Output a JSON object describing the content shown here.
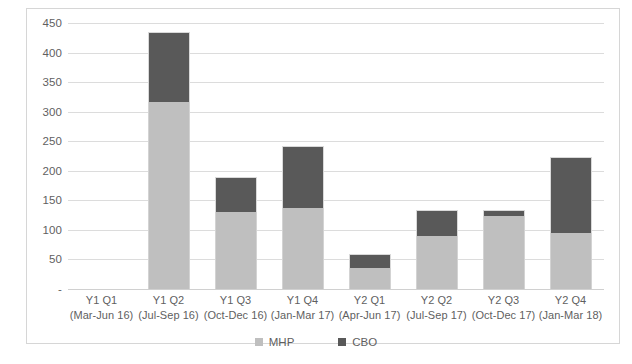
{
  "chart_data": {
    "type": "bar",
    "subtype": "stacked-vertical",
    "title": "",
    "subtitle": "",
    "xlabel": "",
    "ylabel": "",
    "ylim": [
      0,
      450
    ],
    "ytick_values": [
      450,
      400,
      350,
      300,
      250,
      200,
      150,
      100,
      50,
      0
    ],
    "ytick_labels": [
      "450",
      "400",
      "350",
      "300",
      "250",
      "200",
      "150",
      "100",
      "50",
      "-"
    ],
    "grid": true,
    "legend_position": "bottom",
    "categories": [
      "Y1 Q1\n(Mar-Jun 16)",
      "Y1 Q2\n(Jul-Sep 16)",
      "Y1 Q3\n(Oct-Dec 16)",
      "Y1 Q4\n(Jan-Mar 17)",
      "Y2 Q1\n(Apr-Jun 17)",
      "Y2 Q2\n(Jul-Sep 17)",
      "Y2 Q3\n(Oct-Dec 17)",
      "Y2 Q4\n(Jan-Mar 18)"
    ],
    "series": [
      {
        "name": "MHP",
        "color": "#bfbfbf",
        "values": [
          0,
          317,
          130,
          137,
          35,
          89,
          123,
          94
        ]
      },
      {
        "name": "CBO",
        "color": "#595959",
        "values": [
          0,
          118,
          60,
          105,
          25,
          45,
          10,
          130
        ]
      }
    ],
    "totals": [
      0,
      435,
      190,
      242,
      60,
      134,
      133,
      224
    ]
  },
  "axis": {
    "yticks": [
      {
        "label": "450",
        "value": 450
      },
      {
        "label": "400",
        "value": 400
      },
      {
        "label": "350",
        "value": 350
      },
      {
        "label": "300",
        "value": 300
      },
      {
        "label": "250",
        "value": 250
      },
      {
        "label": "200",
        "value": 200
      },
      {
        "label": "150",
        "value": 150
      },
      {
        "label": "100",
        "value": 100
      },
      {
        "label": "50",
        "value": 50
      },
      {
        "label": "-",
        "value": 0
      }
    ],
    "xticks": [
      {
        "line1": "Y1 Q1",
        "line2": "(Mar-Jun 16)"
      },
      {
        "line1": "Y1 Q2",
        "line2": "(Jul-Sep 16)"
      },
      {
        "line1": "Y1 Q3",
        "line2": "(Oct-Dec 16)"
      },
      {
        "line1": "Y1 Q4",
        "line2": "(Jan-Mar 17)"
      },
      {
        "line1": "Y2 Q1",
        "line2": "(Apr-Jun 17)"
      },
      {
        "line1": "Y2 Q2",
        "line2": "(Jul-Sep 17)"
      },
      {
        "line1": "Y2 Q3",
        "line2": "(Oct-Dec 17)"
      },
      {
        "line1": "Y2 Q4",
        "line2": "(Jan-Mar 18)"
      }
    ]
  },
  "legend": {
    "items": [
      {
        "label": "MHP",
        "color": "#bfbfbf",
        "icon": "square-marker-icon"
      },
      {
        "label": "CBO",
        "color": "#595959",
        "icon": "square-marker-icon"
      }
    ]
  },
  "style": {
    "mhp_color": "#bfbfbf",
    "cbo_color": "#595959",
    "gridline_color": "#dcdcdc",
    "border_color": "#d6d6d6",
    "text_color": "#5f5f5f",
    "background": "#ffffff"
  }
}
